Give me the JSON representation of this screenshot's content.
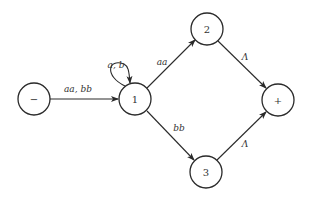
{
  "diagram": {
    "type": "finite-automaton / transition graph",
    "nodes": [
      {
        "id": "start",
        "label": "−",
        "x": 34,
        "y": 99
      },
      {
        "id": "n1",
        "label": "1",
        "x": 135,
        "y": 99
      },
      {
        "id": "n2",
        "label": "2",
        "x": 207,
        "y": 29
      },
      {
        "id": "n3",
        "label": "3",
        "x": 206,
        "y": 172
      },
      {
        "id": "final",
        "label": "+",
        "x": 278,
        "y": 100
      }
    ],
    "edges": [
      {
        "from": "start",
        "to": "n1",
        "label": "aa, bb"
      },
      {
        "from": "n1",
        "to": "n1",
        "label": "a, b"
      },
      {
        "from": "n1",
        "to": "n2",
        "label": "aa"
      },
      {
        "from": "n1",
        "to": "n3",
        "label": "bb"
      },
      {
        "from": "n2",
        "to": "final",
        "label": "Λ"
      },
      {
        "from": "n3",
        "to": "final",
        "label": "Λ"
      }
    ]
  }
}
